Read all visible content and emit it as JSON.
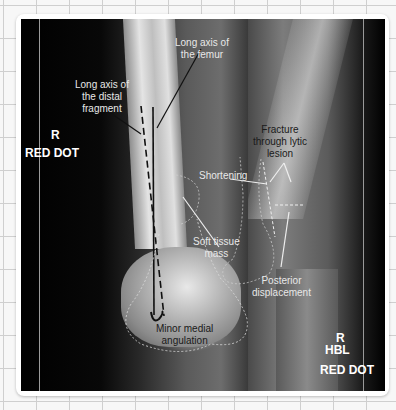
{
  "image": {
    "description": "Two knee/distal femur radiographs (AP and lateral) with annotated fracture findings, mounted on grid paper",
    "background": "grid-paper",
    "colors": {
      "frame": "#ffffff",
      "xray_bg": "#000000",
      "annotation_light": "#e8e8e8",
      "annotation_dark": "#1a1a1a"
    }
  },
  "left_view": {
    "markers": {
      "side": "R",
      "dot": "RED DOT"
    },
    "annotations": {
      "long_axis_femur": "Long axis of\nthe femur",
      "long_axis_distal": "Long axis of\nthe distal\nfragment",
      "shortening": "Shortening",
      "soft_tissue_mass": "Soft tissue\nmass",
      "minor_medial_angulation": "Minor medial\nangulation"
    }
  },
  "right_view": {
    "markers": {
      "side": "R",
      "projection": "HBL",
      "dot": "RED DOT"
    },
    "annotations": {
      "fracture": "Fracture\nthrough lytic\nlesion",
      "posterior_displacement": "Posterior\ndisplacement"
    }
  }
}
